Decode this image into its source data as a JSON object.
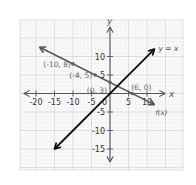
{
  "chart_data": {
    "type": "line",
    "title": "",
    "xlabel": "x",
    "ylabel": "y",
    "xlim": [
      -22,
      14
    ],
    "ylim": [
      -20,
      19
    ],
    "grid": true,
    "x_ticks": [
      -20,
      -15,
      -10,
      -5,
      5,
      10
    ],
    "x_tick_labels": [
      "-20",
      "-15",
      "-10",
      "-5",
      "5",
      "10"
    ],
    "y_ticks": [
      10,
      5,
      -5,
      -10,
      -15
    ],
    "y_tick_labels": [
      "10",
      "5",
      "-5",
      "-10",
      "-15"
    ],
    "origin_label": "0",
    "series": [
      {
        "name": "f(x)",
        "label": "f(x)",
        "equation": "y = -0.5x + 3",
        "x_range": [
          -19,
          12
        ],
        "points": [
          {
            "x": -10,
            "y": 8,
            "label": "(-10, 8)"
          },
          {
            "x": -4,
            "y": 5,
            "label": "(-4, 5)"
          },
          {
            "x": 0,
            "y": 3,
            "label": "(0, 3)"
          },
          {
            "x": 6,
            "y": 0,
            "label": "(6, 0)"
          }
        ],
        "color": "#555555"
      },
      {
        "name": "y = x",
        "label": "y = x",
        "equation": "y = x",
        "x_range": [
          -15,
          12
        ],
        "points": [],
        "color": "#111111"
      }
    ]
  }
}
